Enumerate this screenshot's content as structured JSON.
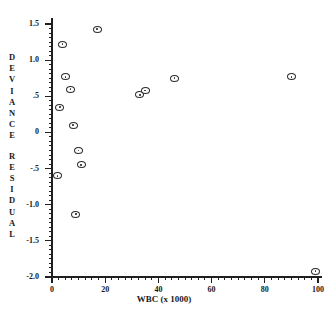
{
  "chart_data": {
    "type": "scatter",
    "title": "",
    "xlabel": "WBC (x 1000)",
    "ylabel": "DEVIANCE RESIDUAL",
    "xlim": [
      0,
      100
    ],
    "ylim": [
      -2.0,
      1.5
    ],
    "grid": false,
    "legend": null,
    "xticks": [
      0,
      20,
      40,
      60,
      80,
      100
    ],
    "xtick_labels": [
      "0",
      "20",
      "40",
      "60",
      "80",
      "100"
    ],
    "yticks": [
      1.5,
      1.0,
      0.5,
      0,
      -0.5,
      -1.0,
      -1.5,
      -2.0
    ],
    "ytick_labels": [
      "1.5",
      "1.0",
      ".5",
      "0",
      "-.5",
      "-1.0",
      "-1.5",
      "-2.0"
    ],
    "minor_tick_count_x": 40,
    "minor_tick_count_y": 56,
    "marker": "circle-with-center-dot",
    "marker_color": "#2b2b2b",
    "points": [
      {
        "x": 2,
        "y": -0.6
      },
      {
        "x": 3,
        "y": 0.35
      },
      {
        "x": 4,
        "y": 1.22
      },
      {
        "x": 5,
        "y": 0.77
      },
      {
        "x": 7,
        "y": 0.6
      },
      {
        "x": 8,
        "y": 0.1
      },
      {
        "x": 9,
        "y": -1.13
      },
      {
        "x": 10,
        "y": -0.25
      },
      {
        "x": 11,
        "y": -0.45
      },
      {
        "x": 17,
        "y": 1.43
      },
      {
        "x": 33,
        "y": 0.52
      },
      {
        "x": 35,
        "y": 0.58
      },
      {
        "x": 46,
        "y": 0.75
      },
      {
        "x": 90,
        "y": 0.77
      },
      {
        "x": 99,
        "y": -1.92
      }
    ]
  },
  "ylabel_chars": {
    "word1": [
      "D",
      "E",
      "V",
      "I",
      "A",
      "N",
      "C",
      "E"
    ],
    "word2": [
      "R",
      "E",
      "S",
      "I",
      "D",
      "U",
      "A",
      "L"
    ]
  }
}
